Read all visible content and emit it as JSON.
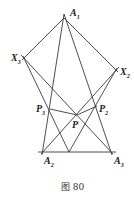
{
  "figure": {
    "caption": "图 80",
    "points": {
      "A1": {
        "label": "A",
        "sub": "1",
        "x": 64,
        "y": 18
      },
      "A2": {
        "label": "A",
        "sub": "2",
        "x": 43,
        "y": 152
      },
      "A3": {
        "label": "A",
        "sub": "3",
        "x": 111,
        "y": 152
      },
      "X2": {
        "label": "X",
        "sub": "2",
        "x": 116,
        "y": 70
      },
      "X3": {
        "label": "X",
        "sub": "3",
        "x": 24,
        "y": 58
      },
      "P2": {
        "label": "P",
        "sub": "2",
        "x": 97,
        "y": 106
      },
      "P3": {
        "label": "P",
        "sub": "3",
        "x": 50,
        "y": 109
      },
      "P": {
        "label": "P",
        "sub": "",
        "x": 77,
        "y": 115
      },
      "M": {
        "label": "",
        "sub": "",
        "x": 69,
        "y": 152
      }
    },
    "segments": [
      [
        "A1",
        "X3"
      ],
      [
        "A1",
        "X2"
      ],
      [
        "A1",
        "A2"
      ],
      [
        "A1",
        "A3"
      ],
      [
        "A2",
        "A3"
      ],
      [
        "X3",
        "A3"
      ],
      [
        "X3",
        "M"
      ],
      [
        "X2",
        "A2"
      ],
      [
        "X2",
        "M"
      ],
      [
        "P3",
        "P"
      ],
      [
        "P",
        "P2"
      ]
    ]
  }
}
